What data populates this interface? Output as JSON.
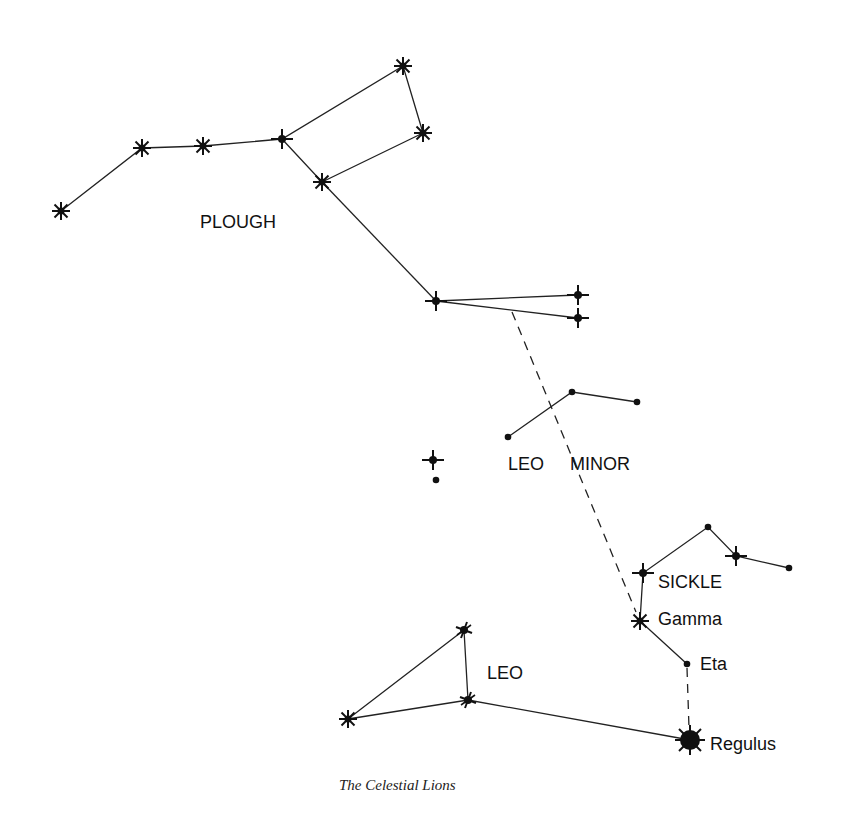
{
  "title": "The Celestial Lions",
  "colors": {
    "ink": "#111111",
    "background": "#ffffff"
  },
  "labels": {
    "plough": "PLOUGH",
    "leo_minor_1": "LEO",
    "leo_minor_2": "MINOR",
    "sickle": "SICKLE",
    "gamma": "Gamma",
    "eta": "Eta",
    "leo": "LEO",
    "regulus": "Regulus"
  },
  "stars": {
    "plough": [
      {
        "x": 61,
        "y": 211,
        "type": "asterisk"
      },
      {
        "x": 142,
        "y": 148,
        "type": "asterisk"
      },
      {
        "x": 203,
        "y": 146,
        "type": "asterisk"
      },
      {
        "x": 282,
        "y": 139,
        "type": "cross"
      },
      {
        "x": 322,
        "y": 182,
        "type": "asterisk"
      },
      {
        "x": 403,
        "y": 66,
        "type": "asterisk"
      },
      {
        "x": 423,
        "y": 133,
        "type": "asterisk"
      },
      {
        "x": 436,
        "y": 301,
        "type": "cross"
      },
      {
        "x": 578,
        "y": 295,
        "type": "cross"
      },
      {
        "x": 578,
        "y": 318,
        "type": "cross"
      }
    ],
    "leo_minor": [
      {
        "x": 508,
        "y": 437,
        "type": "dot"
      },
      {
        "x": 572,
        "y": 392,
        "type": "dot"
      },
      {
        "x": 637,
        "y": 402,
        "type": "dot"
      }
    ],
    "isolated": [
      {
        "x": 433,
        "y": 460,
        "type": "cross"
      },
      {
        "x": 436,
        "y": 480,
        "type": "dot"
      }
    ],
    "sickle": [
      {
        "x": 643,
        "y": 573,
        "type": "cross"
      },
      {
        "x": 708,
        "y": 527,
        "type": "dot"
      },
      {
        "x": 736,
        "y": 556,
        "type": "cross"
      },
      {
        "x": 789,
        "y": 568,
        "type": "dot"
      },
      {
        "x": 640,
        "y": 621,
        "type": "asterisk",
        "name": "Gamma"
      },
      {
        "x": 687,
        "y": 664,
        "type": "dot",
        "name": "Eta"
      },
      {
        "x": 690,
        "y": 740,
        "type": "big",
        "name": "Regulus"
      }
    ],
    "leo": [
      {
        "x": 464,
        "y": 630,
        "type": "star4"
      },
      {
        "x": 468,
        "y": 700,
        "type": "star4"
      },
      {
        "x": 348,
        "y": 719,
        "type": "asterisk"
      }
    ]
  }
}
